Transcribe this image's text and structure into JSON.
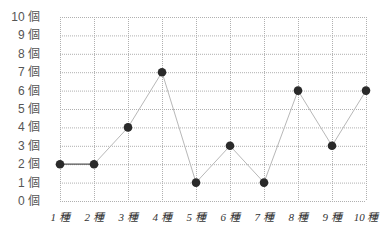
{
  "chart_data": {
    "type": "line",
    "title": "",
    "xlabel": "",
    "ylabel": "",
    "categories": [
      "1 種",
      "2 種",
      "3 種",
      "4 種",
      "5 種",
      "6 種",
      "7 種",
      "8 種",
      "9 種",
      "10 種"
    ],
    "values": [
      2,
      2,
      4,
      7,
      1,
      3,
      1,
      6,
      3,
      6
    ],
    "y_ticks": [
      "0 個",
      "1 個",
      "2 個",
      "3 個",
      "4 個",
      "5 個",
      "6 個",
      "7 個",
      "8 個",
      "9 個",
      "10 個"
    ],
    "ylim": [
      0,
      10
    ],
    "grid": true,
    "grid_style": "dotted",
    "legend": null
  },
  "colors": {
    "grid": "#b0b0b0",
    "line": "#b8b8b8",
    "first_segment": "#555555",
    "marker": "#2a2a2a"
  }
}
